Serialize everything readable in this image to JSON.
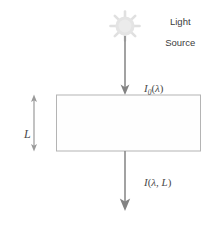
{
  "figure": {
    "background_color": "#ffffff",
    "width": 208,
    "height": 228
  },
  "source": {
    "icon_name": "sun-icon",
    "icon_color": "#e2e2e2",
    "label_line1": "Light",
    "label_line2": "Source"
  },
  "incident_beam": {
    "arrow_name": "incident-light-arrow",
    "arrow_color": "#808080",
    "label_I": "I",
    "label_subscript": "0",
    "label_open_paren": "(",
    "label_lambda": "λ",
    "label_close_paren": ")"
  },
  "medium": {
    "name": "absorbing-medium-rectangle",
    "fill_color": "#fefefe",
    "stroke_color": "#b4b4b4"
  },
  "thickness": {
    "arrow_name": "thickness-double-arrow",
    "arrow_color": "#9a9a9a",
    "label": "L"
  },
  "transmitted_beam": {
    "arrow_name": "transmitted-light-arrow",
    "arrow_color": "#808080",
    "label_I": "I",
    "label_open_paren": "(",
    "label_lambda": "λ",
    "label_comma": ",",
    "label_L": "L",
    "label_close_paren": ")"
  }
}
